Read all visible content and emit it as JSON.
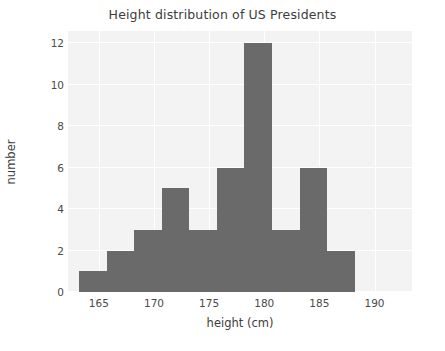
{
  "chart_data": {
    "type": "bar",
    "title": "Height distribution of US Presidents",
    "xlabel": "height (cm)",
    "ylabel": "number",
    "categories": [
      "163.2-165.7",
      "165.7-168.2",
      "168.2-170.7",
      "170.7-173.2",
      "173.2-175.7",
      "175.7-178.2",
      "178.2-180.7",
      "180.7-183.2",
      "183.2-185.7",
      "185.7-188.2"
    ],
    "bin_edges": [
      163.2,
      165.7,
      168.2,
      170.7,
      173.2,
      175.7,
      178.2,
      180.7,
      183.2,
      185.7,
      188.2
    ],
    "values": [
      1,
      2,
      3,
      5,
      3,
      6,
      12,
      3,
      6,
      2
    ],
    "xlim": [
      162.2,
      193.4
    ],
    "ylim": [
      0,
      12.6
    ],
    "xticks": [
      165,
      170,
      175,
      180,
      185,
      190
    ],
    "xtick_labels": [
      "165",
      "170",
      "175",
      "180",
      "185",
      "190"
    ],
    "yticks": [
      0,
      2,
      4,
      6,
      8,
      10,
      12
    ],
    "ytick_labels": [
      "0",
      "2",
      "4",
      "6",
      "8",
      "10",
      "12"
    ],
    "grid": true,
    "grid_color": "#ffffff",
    "legend": null,
    "bar_color": "#6a6a6a",
    "plot_background": "#f3f3f3",
    "figure_background": "#ffffff",
    "text_color": "#3c3c3c"
  }
}
